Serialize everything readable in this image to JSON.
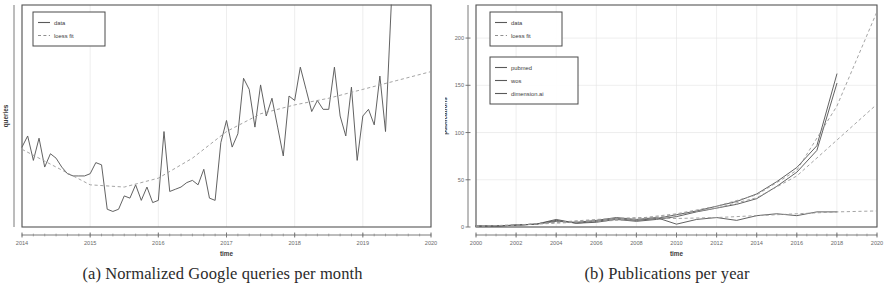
{
  "figure": {
    "subfigures": [
      {
        "id": "a",
        "caption": "(a) Normalized Google queries per month",
        "xlabel": "time",
        "ylabel": "queries"
      },
      {
        "id": "b",
        "caption": "(b) Publications per year",
        "xlabel": "time",
        "ylabel": "publications"
      }
    ]
  },
  "legends": {
    "a": {
      "items": [
        {
          "label": "data",
          "style": "solid"
        },
        {
          "label": "loess fit",
          "style": "dashed"
        }
      ]
    },
    "b_top": {
      "items": [
        {
          "label": "data",
          "style": "solid"
        },
        {
          "label": "loess fit",
          "style": "dashed"
        }
      ]
    },
    "b_bottom": {
      "items": [
        {
          "label": "pubmed",
          "style": "solid"
        },
        {
          "label": "wos",
          "style": "solid"
        },
        {
          "label": "dimension.ai",
          "style": "solid"
        }
      ]
    }
  },
  "chart_data": [
    {
      "id": "a",
      "type": "line",
      "title": "(a) Normalized Google queries per month",
      "xlabel": "time",
      "ylabel": "queries",
      "xlim": [
        2014.0,
        2020.0
      ],
      "ylim": [
        0,
        100
      ],
      "xticks": [
        2014,
        2015,
        2016,
        2017,
        2018,
        2019,
        2020
      ],
      "xticklabels": [
        "2014",
        "2015",
        "2016",
        "2017",
        "2018",
        "2019",
        "2020"
      ],
      "yticks": [],
      "yticklabels": [],
      "grid": "vertical",
      "legend_position": "top-left",
      "series": [
        {
          "name": "data",
          "style": "solid",
          "x": [
            2014.0,
            2014.083,
            2014.167,
            2014.25,
            2014.333,
            2014.417,
            2014.5,
            2014.583,
            2014.667,
            2014.75,
            2014.833,
            2014.917,
            2015.0,
            2015.083,
            2015.167,
            2015.25,
            2015.333,
            2015.417,
            2015.5,
            2015.583,
            2015.667,
            2015.75,
            2015.833,
            2015.917,
            2016.0,
            2016.083,
            2016.167,
            2016.25,
            2016.333,
            2016.417,
            2016.5,
            2016.583,
            2016.667,
            2016.75,
            2016.833,
            2016.917,
            2017.0,
            2017.083,
            2017.167,
            2017.25,
            2017.333,
            2017.417,
            2017.5,
            2017.583,
            2017.667,
            2017.75,
            2017.833,
            2017.917,
            2018.0,
            2018.083,
            2018.167,
            2018.25,
            2018.333,
            2018.417,
            2018.5,
            2018.583,
            2018.667,
            2018.75,
            2018.833,
            2018.917,
            2019.0,
            2019.083,
            2019.167,
            2019.25,
            2019.333,
            2019.417
          ],
          "y": [
            36,
            41,
            30,
            40,
            27,
            33,
            31,
            27,
            24,
            23,
            23,
            23,
            24,
            29,
            28,
            8,
            7,
            8,
            14,
            13,
            19,
            12,
            18,
            11,
            12,
            43,
            16,
            17,
            18,
            20,
            21,
            19,
            26,
            13,
            12,
            38,
            48,
            36,
            42,
            67,
            62,
            45,
            64,
            50,
            58,
            45,
            32,
            59,
            57,
            72,
            62,
            52,
            57,
            53,
            53,
            72,
            50,
            41,
            63,
            30,
            50,
            53,
            46,
            68,
            43,
            100
          ]
        },
        {
          "name": "loess fit",
          "style": "dashed",
          "x": [
            2014.0,
            2014.5,
            2015.0,
            2015.5,
            2016.0,
            2016.5,
            2017.0,
            2017.5,
            2018.0,
            2018.5,
            2019.0,
            2019.5,
            2020.0
          ],
          "y": [
            35,
            27,
            19,
            18,
            22,
            31,
            43,
            51,
            55,
            58,
            62,
            66,
            70
          ]
        }
      ]
    },
    {
      "id": "b",
      "type": "line",
      "title": "(b) Publications per year",
      "xlabel": "time",
      "ylabel": "publications",
      "xlim": [
        2000,
        2020
      ],
      "ylim": [
        0,
        235
      ],
      "xticks": [
        2000,
        2002,
        2004,
        2006,
        2008,
        2010,
        2012,
        2014,
        2016,
        2018,
        2020
      ],
      "xticklabels": [
        "2000",
        "2002",
        "2004",
        "2006",
        "2008",
        "2010",
        "2012",
        "2014",
        "2016",
        "2018",
        "2020"
      ],
      "yticks": [
        0,
        50,
        100,
        150,
        200
      ],
      "yticklabels": [
        "0",
        "50",
        "100",
        "150",
        "200"
      ],
      "grid": "both",
      "legend_position": "top-left",
      "series": [
        {
          "name": "pubmed",
          "style": "solid",
          "x": [
            2000,
            2001,
            2002,
            2003,
            2004,
            2005,
            2006,
            2007,
            2008,
            2009,
            2010,
            2011,
            2012,
            2013,
            2014,
            2015,
            2016,
            2017,
            2018
          ],
          "y": [
            1,
            1,
            2,
            3,
            8,
            4,
            6,
            9,
            7,
            9,
            13,
            17,
            22,
            27,
            35,
            48,
            63,
            86,
            162
          ]
        },
        {
          "name": "wos",
          "style": "solid",
          "x": [
            2000,
            2001,
            2002,
            2003,
            2004,
            2005,
            2006,
            2007,
            2008,
            2009,
            2010,
            2011,
            2012,
            2013,
            2014,
            2015,
            2016,
            2017,
            2018
          ],
          "y": [
            1,
            1,
            2,
            3,
            7,
            4,
            5,
            8,
            6,
            8,
            11,
            16,
            20,
            24,
            30,
            43,
            58,
            81,
            152
          ]
        },
        {
          "name": "dimension.ai",
          "style": "solid",
          "x": [
            2000,
            2001,
            2002,
            2003,
            2004,
            2005,
            2006,
            2007,
            2008,
            2009,
            2010,
            2011,
            2012,
            2013,
            2014,
            2015,
            2016,
            2017,
            2018
          ],
          "y": [
            1,
            1,
            2,
            3,
            6,
            5,
            7,
            10,
            8,
            10,
            3,
            8,
            10,
            7,
            12,
            14,
            12,
            16,
            16
          ]
        },
        {
          "name": "loess fit pubmed",
          "style": "dashed",
          "x": [
            2000,
            2002,
            2004,
            2006,
            2008,
            2010,
            2012,
            2014,
            2016,
            2018,
            2020
          ],
          "y": [
            1,
            2,
            5,
            7,
            9,
            14,
            22,
            34,
            60,
            128,
            228
          ]
        },
        {
          "name": "loess fit wos",
          "style": "dashed",
          "x": [
            2000,
            2002,
            2004,
            2006,
            2008,
            2010,
            2012,
            2014,
            2016,
            2018,
            2020
          ],
          "y": [
            1,
            2,
            4,
            6,
            8,
            13,
            20,
            31,
            54,
            92,
            130
          ]
        },
        {
          "name": "loess fit dimension.ai",
          "style": "dashed",
          "x": [
            2000,
            2002,
            2004,
            2006,
            2008,
            2010,
            2012,
            2014,
            2016,
            2018,
            2020
          ],
          "y": [
            1,
            2,
            5,
            8,
            10,
            9,
            10,
            12,
            14,
            16,
            17
          ]
        }
      ]
    }
  ]
}
